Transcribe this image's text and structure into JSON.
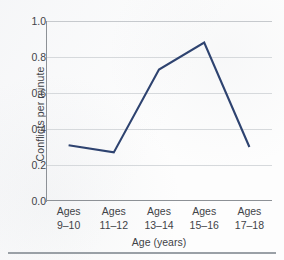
{
  "chart_data": {
    "type": "line",
    "title": "",
    "subtitle": "",
    "xlabel": "Age (years)",
    "ylabel": "Conflicts per minute",
    "categories": [
      "Ages 9–10",
      "Ages 11–12",
      "Ages 13–14",
      "Ages 15–16",
      "Ages 17–18"
    ],
    "category_lines": [
      [
        "Ages",
        "9–10"
      ],
      [
        "Ages",
        "11–12"
      ],
      [
        "Ages",
        "13–14"
      ],
      [
        "Ages",
        "15–16"
      ],
      [
        "Ages",
        "17–18"
      ]
    ],
    "values": [
      0.31,
      0.27,
      0.73,
      0.88,
      0.3
    ],
    "series": [
      {
        "name": "Conflicts per minute",
        "values": [
          0.31,
          0.27,
          0.73,
          0.88,
          0.3
        ],
        "color": "#2e4370"
      }
    ],
    "ylim": [
      0.0,
      1.0
    ],
    "ytick_values": [
      1.0,
      0.8,
      0.6,
      0.4,
      0.2,
      0.0
    ],
    "ytick_labels": [
      "1.0",
      "0.8",
      "0.6",
      "0.4",
      "0.2",
      "0.0"
    ],
    "grid": true,
    "grid_axis": "y",
    "legend": false,
    "legend_position": "none",
    "markers": false,
    "line_color": "#2e4370",
    "grid_color": "#d6d9dc",
    "axis_color": "#8d9196",
    "text_color": "#3f4347",
    "background_color": "#fdfdfd"
  }
}
